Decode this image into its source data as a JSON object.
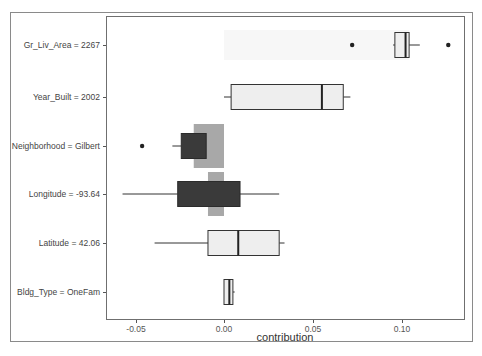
{
  "chart_data": {
    "type": "boxplot",
    "title": "",
    "xlabel": "contribution",
    "ylabel": "",
    "xlim": [
      -0.065,
      0.135
    ],
    "x_ticks": [
      -0.05,
      0.0,
      0.05,
      0.1
    ],
    "x_tick_labels": [
      "-0.05",
      "0.00",
      "0.05",
      "0.10"
    ],
    "grid": false,
    "legend": null,
    "categories": [
      "Gr_Liv_Area = 2267",
      "Year_Built = 2002",
      "Neighborhood = Gilbert",
      "Longitude = -93.64",
      "Latitude = 42.06",
      "Bldg_Type = OneFam"
    ],
    "series": [
      {
        "name": "Gr_Liv_Area = 2267",
        "whisker_low": 0.095,
        "q1": 0.096,
        "median": 0.102,
        "q3": 0.104,
        "whisker_high": 0.11,
        "outliers": [
          0.072,
          0.126
        ],
        "fill": "#eeeeee",
        "bar": [
          0.0,
          0.104
        ],
        "bar_fill": "#f7f7f7"
      },
      {
        "name": "Year_Built = 2002",
        "whisker_low": 0.0,
        "q1": 0.004,
        "median": 0.055,
        "q3": 0.067,
        "whisker_high": 0.071,
        "outliers": [],
        "fill": "#eeeeee"
      },
      {
        "name": "Neighborhood = Gilbert",
        "whisker_low": -0.029,
        "q1": -0.024,
        "median": -0.016,
        "q3": -0.01,
        "whisker_high": -0.01,
        "outliers": [
          -0.046
        ],
        "fill": "#3a3a3a",
        "bar": [
          -0.017,
          0.0
        ],
        "bar_fill": "#a8a8a8"
      },
      {
        "name": "Longitude = -93.64",
        "whisker_low": -0.057,
        "q1": -0.026,
        "median": -0.009,
        "q3": 0.009,
        "whisker_high": 0.031,
        "outliers": [],
        "fill": "#3a3a3a",
        "bar": [
          -0.009,
          0.0
        ],
        "bar_fill": "#a8a8a8"
      },
      {
        "name": "Latitude = 42.06",
        "whisker_low": -0.039,
        "q1": -0.009,
        "median": 0.008,
        "q3": 0.031,
        "whisker_high": 0.034,
        "outliers": [],
        "fill": "#eeeeee"
      },
      {
        "name": "Bldg_Type = OneFam",
        "whisker_low": 0.0,
        "q1": 0.0,
        "median": 0.003,
        "q3": 0.005,
        "whisker_high": 0.006,
        "outliers": [],
        "fill": "#eeeeee"
      }
    ]
  },
  "axis": {
    "x_title": "contribution",
    "x_tick_labels": [
      "-0.05",
      "0.00",
      "0.05",
      "0.10"
    ],
    "y_labels": [
      "Gr_Liv_Area = 2267",
      "Year_Built = 2002",
      "Neighborhood = Gilbert",
      "Longitude = -93.64",
      "Latitude = 42.06",
      "Bldg_Type = OneFam"
    ]
  },
  "colors": {
    "box_light": "#eeeeee",
    "box_dark": "#3a3a3a",
    "bar_gray": "#a8a8a8",
    "line": "#333333"
  }
}
